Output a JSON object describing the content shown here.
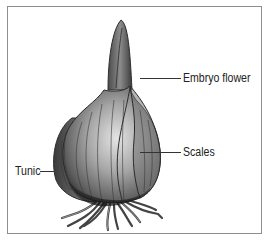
{
  "diagram": {
    "labels": [
      {
        "id": "embryo-flower",
        "text": "Embryo flower"
      },
      {
        "id": "scales",
        "text": "Scales"
      },
      {
        "id": "tunic",
        "text": "Tunic"
      }
    ],
    "colors": {
      "border": "#8e8e8e",
      "bulb_dark": "#3a3a3a",
      "bulb_mid": "#7a7a7a",
      "bulb_light": "#d8d8d8",
      "lines": "#333333"
    }
  }
}
